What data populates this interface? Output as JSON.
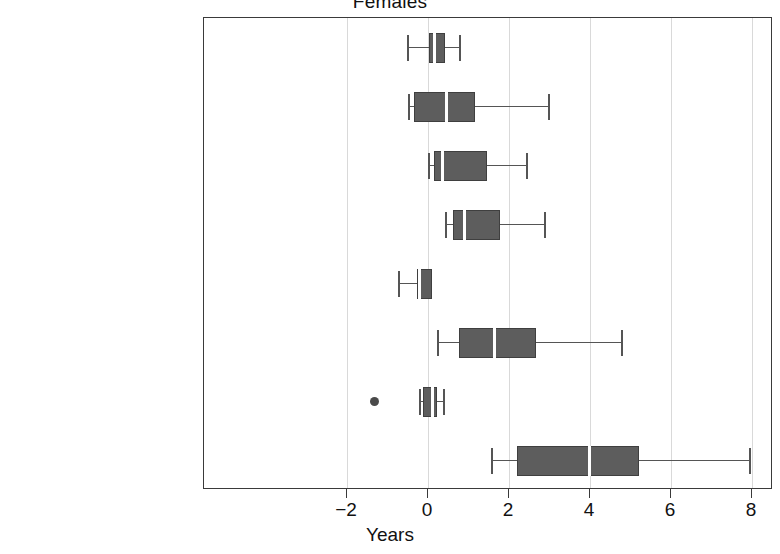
{
  "chart_data": {
    "type": "box",
    "title": "Females",
    "xlabel": "Years",
    "ylabel": "",
    "xlim": [
      -3.2,
      8.5
    ],
    "xticks": [
      -2,
      0,
      2,
      4,
      6,
      8
    ],
    "xticklabels": [
      "−2",
      "0",
      "2",
      "4",
      "6",
      "8"
    ],
    "grid": "vertical",
    "legend": "none",
    "categories": [
      "Neoplasms",
      "Circulatory Diseases",
      "Respiratory Disease",
      "Digestive Diseases",
      "Diabetes",
      "Infectious Diseases",
      "Accidents",
      "Ill-defined Diseases"
    ],
    "boxes": [
      {
        "category": "Neoplasms",
        "whisker_low": -0.52,
        "q1": 0.03,
        "median": 0.17,
        "q3": 0.42,
        "whisker_high": 0.77,
        "outliers": []
      },
      {
        "category": "Circulatory Diseases",
        "whisker_low": -0.5,
        "q1": -0.35,
        "median": 0.46,
        "q3": 1.16,
        "whisker_high": 2.96,
        "outliers": []
      },
      {
        "category": "Respiratory Disease",
        "whisker_low": 0.0,
        "q1": 0.15,
        "median": 0.35,
        "q3": 1.46,
        "whisker_high": 2.42,
        "outliers": []
      },
      {
        "category": "Digestive Diseases",
        "whisker_low": 0.42,
        "q1": 0.62,
        "median": 0.91,
        "q3": 1.78,
        "whisker_high": 2.86,
        "outliers": []
      },
      {
        "category": "Diabetes",
        "whisker_low": -0.74,
        "q1": -0.27,
        "median": -0.2,
        "q3": 0.1,
        "whisker_high": 0.1,
        "outliers": []
      },
      {
        "category": "Infectious Diseases",
        "whisker_low": 0.22,
        "q1": 0.77,
        "median": 1.63,
        "q3": 2.67,
        "whisker_high": 4.77,
        "outliers": []
      },
      {
        "category": "Accidents",
        "whisker_low": -0.22,
        "q1": -0.12,
        "median": 0.1,
        "q3": 0.22,
        "whisker_high": 0.37,
        "outliers": [
          -1.33
        ]
      },
      {
        "category": "Ill-defined Diseases",
        "whisker_low": 1.55,
        "q1": 2.2,
        "median": 3.98,
        "q3": 5.2,
        "whisker_high": 7.92,
        "outliers": []
      }
    ],
    "colors": {
      "box_fill": "#5d5d5d",
      "box_edge": "#3f3f3f",
      "median": "#ffffff",
      "whisker": "#555555",
      "grid": "#d9d9d9",
      "frame": "#3a3a3a",
      "text": "#111111"
    }
  }
}
